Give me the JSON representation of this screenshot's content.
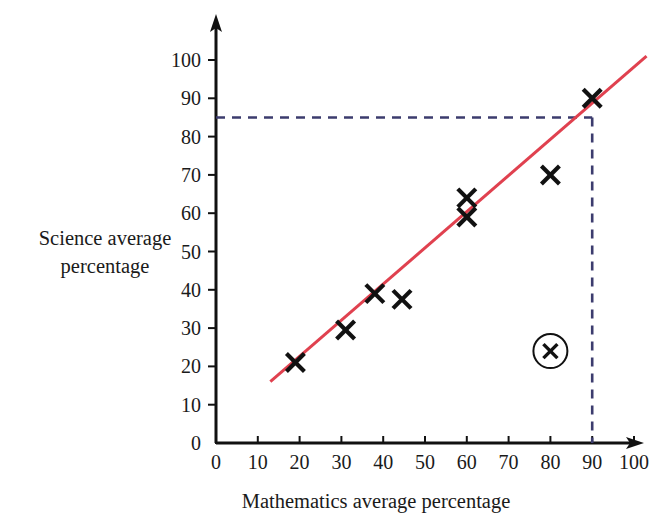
{
  "chart_data": {
    "type": "scatter",
    "title": "",
    "xlabel": "Mathematics average percentage",
    "ylabel": "Science average percentage",
    "ylabel_line1": "Science average",
    "ylabel_line2": "percentage",
    "xlim": [
      0,
      100
    ],
    "ylim": [
      0,
      100
    ],
    "x_ticks": [
      0,
      10,
      20,
      30,
      40,
      50,
      60,
      70,
      80,
      90,
      100
    ],
    "y_ticks": [
      0,
      10,
      20,
      30,
      40,
      50,
      60,
      70,
      80,
      90,
      100
    ],
    "x_tick_labels": [
      "0",
      "10",
      "20",
      "30",
      "40",
      "50",
      "60",
      "70",
      "80",
      "90",
      "100"
    ],
    "y_tick_labels": [
      "0",
      "10",
      "20",
      "30",
      "40",
      "50",
      "60",
      "70",
      "80",
      "90",
      "100"
    ],
    "grid": false,
    "legend": false,
    "marker": "x",
    "points": [
      {
        "x": 19,
        "y": 21
      },
      {
        "x": 31,
        "y": 29.5
      },
      {
        "x": 38,
        "y": 39
      },
      {
        "x": 44.5,
        "y": 37.5
      },
      {
        "x": 60,
        "y": 64
      },
      {
        "x": 60,
        "y": 59
      },
      {
        "x": 80,
        "y": 70
      },
      {
        "x": 90,
        "y": 90
      }
    ],
    "highlighted_point": {
      "x": 80,
      "y": 24,
      "annotation": "circled-outlier"
    },
    "trend_line": {
      "name": "line of best fit",
      "color": "#e0414f",
      "x1": 13,
      "y1": 16,
      "x2": 103,
      "y2": 101
    },
    "guide_lines": {
      "color": "#3c3c6e",
      "style": "dashed",
      "horizontal_y": 85,
      "vertical_x": 90,
      "horizontal_from_x": 0,
      "vertical_from_y": 0
    },
    "axis_color": "#111111"
  }
}
